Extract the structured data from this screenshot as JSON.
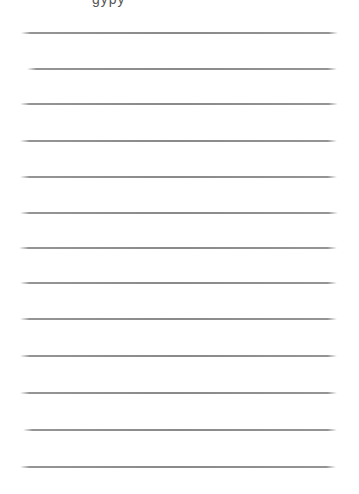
{
  "page": {
    "background": "#ffffff",
    "line_color": "#8a8a8a",
    "top_text_fragment": "gypy"
  },
  "lines": [
    {
      "y": 32,
      "x1": 21,
      "x2": 338
    },
    {
      "y": 68,
      "x1": 27,
      "x2": 337
    },
    {
      "y": 103,
      "x1": 20,
      "x2": 338
    },
    {
      "y": 140,
      "x1": 20,
      "x2": 337
    },
    {
      "y": 176,
      "x1": 20,
      "x2": 337
    },
    {
      "y": 212,
      "x1": 20,
      "x2": 338
    },
    {
      "y": 247,
      "x1": 19,
      "x2": 337
    },
    {
      "y": 282,
      "x1": 20,
      "x2": 337
    },
    {
      "y": 318,
      "x1": 20,
      "x2": 337
    },
    {
      "y": 355,
      "x1": 20,
      "x2": 337
    },
    {
      "y": 392,
      "x1": 20,
      "x2": 337
    },
    {
      "y": 429,
      "x1": 23,
      "x2": 337
    },
    {
      "y": 466,
      "x1": 20,
      "x2": 336
    }
  ]
}
